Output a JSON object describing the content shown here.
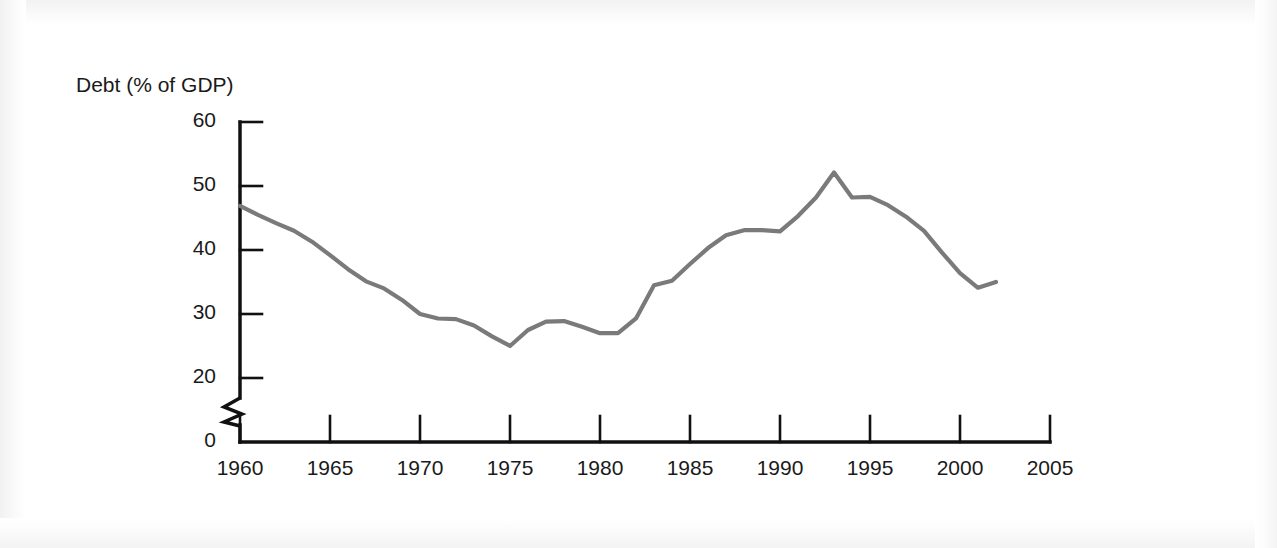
{
  "chart_data": {
    "type": "line",
    "title": "",
    "subtitle": "",
    "ylabel": "Debt (% of GDP)",
    "xlabel": "",
    "xlim": [
      1960,
      2005
    ],
    "ylim": [
      0,
      60
    ],
    "y_axis_break": true,
    "y_break_between": [
      0,
      20
    ],
    "grid": false,
    "legend": null,
    "line_color": "#7a7a7a",
    "axis_color": "#111111",
    "xticks": [
      1960,
      1965,
      1970,
      1975,
      1980,
      1985,
      1990,
      1995,
      2000,
      2005
    ],
    "xtick_labels": [
      "1960",
      "1965",
      "1970",
      "1975",
      "1980",
      "1985",
      "1990",
      "1995",
      "2000",
      "2005"
    ],
    "yticks": [
      0,
      20,
      30,
      40,
      50,
      60
    ],
    "ytick_labels": [
      "0",
      "20",
      "30",
      "40",
      "50",
      "60"
    ],
    "series": [
      {
        "name": "Debt (% of GDP)",
        "x": [
          1960,
          1961,
          1962,
          1963,
          1964,
          1965,
          1966,
          1967,
          1968,
          1969,
          1970,
          1971,
          1972,
          1973,
          1974,
          1975,
          1976,
          1977,
          1978,
          1979,
          1980,
          1981,
          1982,
          1983,
          1984,
          1985,
          1986,
          1987,
          1988,
          1989,
          1990,
          1991,
          1992,
          1993,
          1994,
          1995,
          1996,
          1997,
          1998,
          1999,
          2000,
          2001,
          2002
        ],
        "values": [
          46.9,
          45.5,
          44.2,
          43.0,
          41.3,
          39.2,
          37.0,
          35.1,
          34.0,
          32.2,
          30.0,
          29.3,
          29.2,
          28.2,
          26.5,
          25.0,
          27.5,
          28.8,
          28.9,
          28.0,
          27.0,
          27.0,
          29.3,
          34.5,
          35.2,
          37.8,
          40.3,
          42.3,
          43.1,
          43.1,
          42.9,
          45.3,
          48.2,
          52.1,
          48.2,
          48.3,
          47.0,
          45.2,
          43.0,
          39.6,
          36.4,
          34.1,
          35.0
        ]
      }
    ]
  },
  "axis_label": {
    "y_title": "Debt (% of GDP)"
  }
}
